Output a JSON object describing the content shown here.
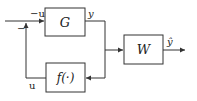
{
  "diagram": {
    "type": "block-diagram",
    "blocks": [
      {
        "id": "G",
        "label": "G"
      },
      {
        "id": "f",
        "label": "f(·)"
      },
      {
        "id": "W",
        "label": "W"
      }
    ],
    "signals": {
      "input_label": "−u",
      "summing_sign": "−",
      "G_output_label": "y",
      "feedback_label": "u",
      "W_output_label": "ŷ"
    },
    "colors": {
      "line": "#333333",
      "background": "#ffffff"
    }
  }
}
